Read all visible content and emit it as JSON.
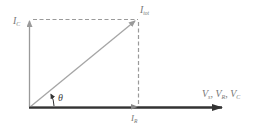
{
  "diagram": {
    "title": "",
    "labels": {
      "i_total": "I",
      "i_total_sub": "tot",
      "i_c": "I",
      "i_c_sub": "C",
      "i_r": "I",
      "i_r_sub": "R",
      "theta": "θ",
      "v_axis_v1": "V",
      "v_axis_v1_sub": "s",
      "v_axis_sep1": ", ",
      "v_axis_v2": "V",
      "v_axis_v2_sub": "R",
      "v_axis_sep2": ", ",
      "v_axis_v3": "V",
      "v_axis_v3_sub": "C"
    },
    "vectors": [
      {
        "name": "I_C",
        "from": [
          29,
          107
        ],
        "to": [
          29,
          20
        ],
        "style": "solid-gray"
      },
      {
        "name": "I_tot",
        "from": [
          29,
          107
        ],
        "to": [
          136,
          20
        ],
        "style": "solid-gray"
      },
      {
        "name": "I_R",
        "from": [
          29,
          107
        ],
        "to": [
          137,
          107
        ],
        "style": "solid-gray"
      },
      {
        "name": "V_s, V_R, V_C",
        "from": [
          29,
          107
        ],
        "to": [
          222,
          107
        ],
        "style": "thick-dark"
      }
    ],
    "colors": {
      "vector_gray": "#9a9a9a",
      "dashed": "#9a9a9a",
      "axis_dark": "#333333",
      "label": "#777777"
    }
  }
}
